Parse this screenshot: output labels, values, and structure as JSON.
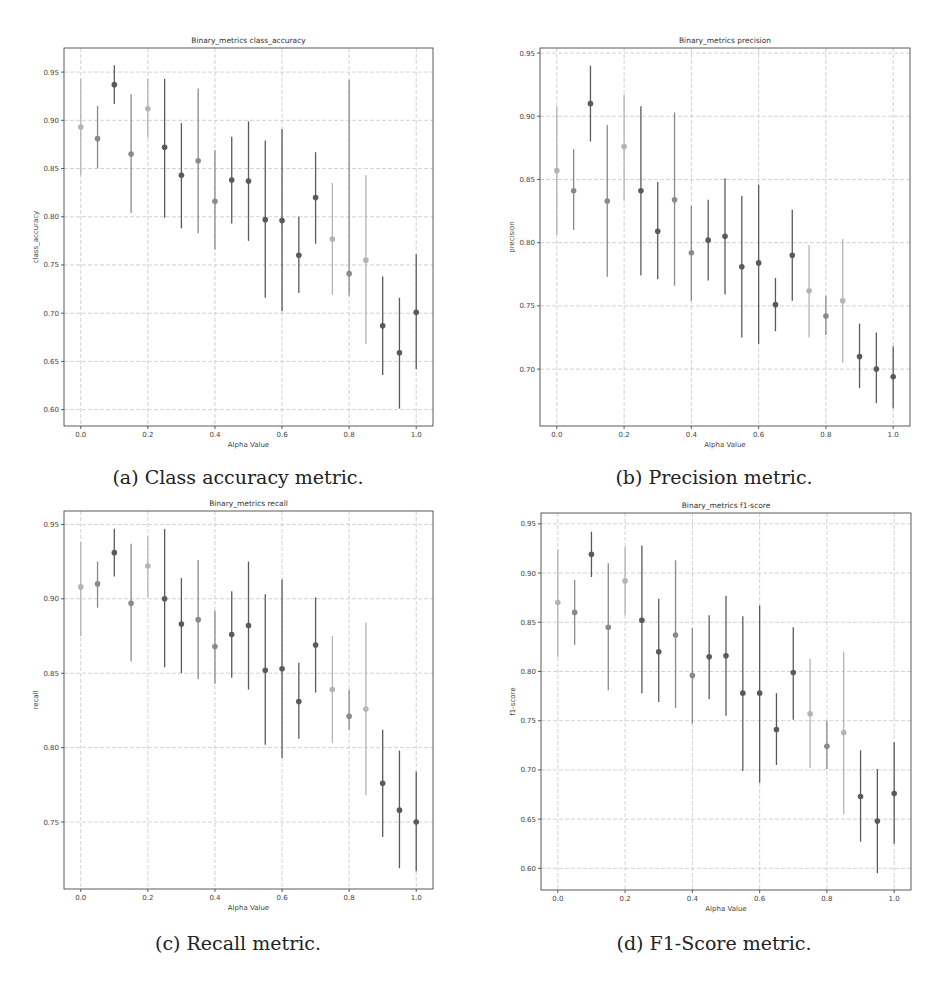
{
  "figure": {
    "captions": {
      "a": "(a) Class accuracy metric.",
      "b": "(b) Precision metric.",
      "c": "(c) Recall metric.",
      "d": "(d) F1-Score metric."
    }
  },
  "colors": {
    "dark": "#5a5a5a",
    "medium": "#8a8a8a",
    "light": "#b4b4b4",
    "grid": "#c8c8c8",
    "axis": "#333333"
  },
  "chart_data": [
    {
      "id": "a",
      "type": "scatter",
      "subtype": "errorbar",
      "title": "Binary_metrics class_accuracy",
      "xlabel": "Alpha Value",
      "ylabel": "class_accuracy",
      "xlim": [
        -0.05,
        1.05
      ],
      "ylim": [
        0.583,
        0.975
      ],
      "xticks": [
        "0.0",
        "0.2",
        "0.4",
        "0.6",
        "0.8",
        "1.0"
      ],
      "yticks": [
        "0.60",
        "0.65",
        "0.70",
        "0.75",
        "0.80",
        "0.85",
        "0.90",
        "0.95"
      ],
      "grid": true,
      "legend": null,
      "x": [
        0.0,
        0.05,
        0.1,
        0.15,
        0.2,
        0.25,
        0.3,
        0.35,
        0.4,
        0.45,
        0.5,
        0.55,
        0.6,
        0.65,
        0.7,
        0.75,
        0.8,
        0.85,
        0.9,
        0.95,
        1.0
      ],
      "y": [
        0.893,
        0.881,
        0.937,
        0.865,
        0.912,
        0.872,
        0.843,
        0.858,
        0.816,
        0.838,
        0.837,
        0.797,
        0.796,
        0.76,
        0.82,
        0.777,
        0.741,
        0.755,
        0.687,
        0.659,
        0.701
      ],
      "err_upper": [
        0.943,
        0.915,
        0.957,
        0.927,
        0.943,
        0.943,
        0.897,
        0.933,
        0.869,
        0.883,
        0.899,
        0.879,
        0.891,
        0.8,
        0.867,
        0.835,
        0.942,
        0.843,
        0.738,
        0.716,
        0.761
      ],
      "err_lower": [
        0.843,
        0.85,
        0.917,
        0.804,
        0.882,
        0.799,
        0.788,
        0.783,
        0.766,
        0.793,
        0.775,
        0.716,
        0.702,
        0.721,
        0.772,
        0.719,
        0.718,
        0.668,
        0.636,
        0.601,
        0.642
      ]
    },
    {
      "id": "b",
      "type": "scatter",
      "subtype": "errorbar",
      "title": "Binary_metrics precision",
      "xlabel": "Alpha Value",
      "ylabel": "precision",
      "xlim": [
        -0.05,
        1.05
      ],
      "ylim": [
        0.655,
        0.954
      ],
      "xticks": [
        "0.0",
        "0.2",
        "0.4",
        "0.6",
        "0.8",
        "1.0"
      ],
      "yticks": [
        "0.70",
        "0.75",
        "0.80",
        "0.85",
        "0.90",
        "0.95"
      ],
      "grid": true,
      "legend": null,
      "x": [
        0.0,
        0.05,
        0.1,
        0.15,
        0.2,
        0.25,
        0.3,
        0.35,
        0.4,
        0.45,
        0.5,
        0.55,
        0.6,
        0.65,
        0.7,
        0.75,
        0.8,
        0.85,
        0.9,
        0.95,
        1.0
      ],
      "y": [
        0.857,
        0.841,
        0.91,
        0.833,
        0.876,
        0.841,
        0.809,
        0.834,
        0.792,
        0.802,
        0.805,
        0.781,
        0.784,
        0.751,
        0.79,
        0.762,
        0.742,
        0.754,
        0.71,
        0.7,
        0.694
      ],
      "err_upper": [
        0.908,
        0.874,
        0.94,
        0.893,
        0.917,
        0.908,
        0.848,
        0.903,
        0.829,
        0.834,
        0.851,
        0.837,
        0.846,
        0.772,
        0.826,
        0.798,
        0.758,
        0.803,
        0.736,
        0.729,
        0.718
      ],
      "err_lower": [
        0.806,
        0.81,
        0.88,
        0.773,
        0.834,
        0.774,
        0.771,
        0.766,
        0.754,
        0.77,
        0.759,
        0.725,
        0.72,
        0.73,
        0.754,
        0.725,
        0.727,
        0.705,
        0.685,
        0.673,
        0.669
      ]
    },
    {
      "id": "c",
      "type": "scatter",
      "subtype": "errorbar",
      "title": "Binary_metrics recall",
      "xlabel": "Alpha Value",
      "ylabel": "recall",
      "xlim": [
        -0.05,
        1.05
      ],
      "ylim": [
        0.705,
        0.959
      ],
      "xticks": [
        "0.0",
        "0.2",
        "0.4",
        "0.6",
        "0.8",
        "1.0"
      ],
      "yticks": [
        "0.75",
        "0.80",
        "0.85",
        "0.90",
        "0.95"
      ],
      "grid": true,
      "legend": null,
      "x": [
        0.0,
        0.05,
        0.1,
        0.15,
        0.2,
        0.25,
        0.3,
        0.35,
        0.4,
        0.45,
        0.5,
        0.55,
        0.6,
        0.65,
        0.7,
        0.75,
        0.8,
        0.85,
        0.9,
        0.95,
        1.0
      ],
      "y": [
        0.908,
        0.91,
        0.931,
        0.897,
        0.922,
        0.9,
        0.883,
        0.886,
        0.868,
        0.876,
        0.882,
        0.852,
        0.853,
        0.831,
        0.869,
        0.839,
        0.821,
        0.826,
        0.776,
        0.758,
        0.75
      ],
      "err_upper": [
        0.938,
        0.925,
        0.947,
        0.937,
        0.942,
        0.947,
        0.914,
        0.926,
        0.892,
        0.905,
        0.925,
        0.903,
        0.913,
        0.857,
        0.901,
        0.875,
        0.839,
        0.884,
        0.812,
        0.798,
        0.784
      ],
      "err_lower": [
        0.875,
        0.894,
        0.915,
        0.858,
        0.901,
        0.854,
        0.85,
        0.846,
        0.843,
        0.847,
        0.839,
        0.802,
        0.793,
        0.806,
        0.837,
        0.803,
        0.812,
        0.768,
        0.74,
        0.719,
        0.717
      ]
    },
    {
      "id": "d",
      "type": "scatter",
      "subtype": "errorbar",
      "title": "Binary_metrics f1-score",
      "xlabel": "Alpha Value",
      "ylabel": "f1-score",
      "xlim": [
        -0.05,
        1.05
      ],
      "ylim": [
        0.578,
        0.961
      ],
      "xticks": [
        "0.0",
        "0.2",
        "0.4",
        "0.6",
        "0.8",
        "1.0"
      ],
      "yticks": [
        "0.60",
        "0.65",
        "0.70",
        "0.75",
        "0.80",
        "0.85",
        "0.90",
        "0.95"
      ],
      "grid": true,
      "legend": null,
      "x": [
        0.0,
        0.05,
        0.1,
        0.15,
        0.2,
        0.25,
        0.3,
        0.35,
        0.4,
        0.45,
        0.5,
        0.55,
        0.6,
        0.65,
        0.7,
        0.75,
        0.8,
        0.85,
        0.9,
        0.95,
        1.0
      ],
      "y": [
        0.87,
        0.86,
        0.919,
        0.845,
        0.892,
        0.852,
        0.82,
        0.837,
        0.796,
        0.815,
        0.816,
        0.778,
        0.778,
        0.741,
        0.799,
        0.757,
        0.724,
        0.738,
        0.673,
        0.648,
        0.676
      ],
      "err_upper": [
        0.924,
        0.893,
        0.942,
        0.91,
        0.927,
        0.928,
        0.874,
        0.913,
        0.844,
        0.857,
        0.877,
        0.856,
        0.867,
        0.778,
        0.845,
        0.813,
        0.75,
        0.82,
        0.72,
        0.701,
        0.728
      ],
      "err_lower": [
        0.815,
        0.827,
        0.896,
        0.781,
        0.857,
        0.778,
        0.769,
        0.763,
        0.747,
        0.772,
        0.755,
        0.699,
        0.687,
        0.705,
        0.751,
        0.702,
        0.701,
        0.655,
        0.627,
        0.595,
        0.625
      ]
    }
  ],
  "point_shades": [
    "light",
    "medium",
    "dark",
    "medium",
    "light",
    "dark",
    "dark",
    "medium",
    "medium",
    "dark",
    "dark",
    "dark",
    "dark",
    "dark",
    "dark",
    "light",
    "medium",
    "light",
    "dark",
    "dark",
    "dark"
  ]
}
